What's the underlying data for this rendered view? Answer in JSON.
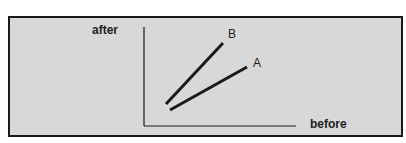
{
  "diagram": {
    "y_axis_label": "after",
    "x_axis_label": "before",
    "lines": [
      {
        "name": "B",
        "label": "B",
        "from": [
          166,
          104
        ],
        "to": [
          223,
          43
        ]
      },
      {
        "name": "A",
        "label": "A",
        "from": [
          170,
          110
        ],
        "to": [
          247,
          67
        ]
      }
    ],
    "colors": {
      "background": "#d8d8d8",
      "stroke": "#1a1a1a",
      "border": "#1a1a1a"
    }
  }
}
